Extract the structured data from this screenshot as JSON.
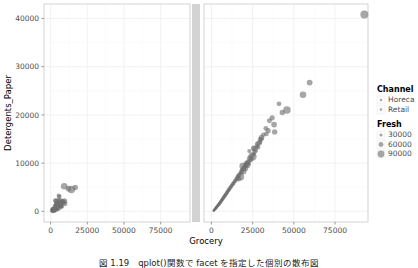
{
  "caption": "図 1.19　qplot()関数で facet を指定した個別の散布図",
  "chart_data": {
    "type": "scatter",
    "title": "",
    "xlabel": "Grocery",
    "ylabel": "Detergents_Paper",
    "xlim": [
      -4500,
      95000
    ],
    "ylim": [
      -2200,
      43000
    ],
    "xticks": [
      0,
      25000,
      50000,
      75000
    ],
    "xticklabels": [
      "0",
      "25000",
      "50000",
      "75000"
    ],
    "yticks": [
      0,
      10000,
      20000,
      30000,
      40000
    ],
    "yticklabels": [
      "0",
      "10000",
      "20000",
      "30000",
      "40000"
    ],
    "grid": true,
    "facet_by": "Channel",
    "facet_panels": [
      "Horeca",
      "Retail"
    ],
    "size_by": "Fresh",
    "point_color": "#6f6f6f",
    "point_opacity": 0.62,
    "legends": [
      {
        "title": "Channel",
        "position": "right",
        "entries": [
          {
            "label": "Horeca"
          },
          {
            "label": "Retail"
          }
        ]
      },
      {
        "title": "Fresh",
        "position": "right",
        "entries": [
          {
            "label": "30000",
            "size": 1.5
          },
          {
            "label": "60000",
            "size": 2.4
          },
          {
            "label": "90000",
            "size": 3.4
          }
        ]
      }
    ],
    "series": [
      {
        "name": "Horeca",
        "panel": 0,
        "points": [
          [
            3516,
            1382,
            7057
          ],
          [
            7684,
            965,
            6353
          ],
          [
            4221,
            507,
            13265
          ],
          [
            6747,
            1153,
            9413
          ],
          [
            9656,
            1630,
            12126
          ],
          [
            5614,
            3242,
            7579
          ],
          [
            2310,
            353,
            18601
          ],
          [
            5570,
            1696,
            9396
          ],
          [
            1630,
            443,
            10766
          ],
          [
            3253,
            2223,
            9612
          ],
          [
            3860,
            2134,
            11355
          ],
          [
            5963,
            3045,
            7723
          ],
          [
            1345,
            166,
            13162
          ],
          [
            1535,
            437,
            5734
          ],
          [
            3868,
            547,
            9374
          ],
          [
            2395,
            223,
            3352
          ],
          [
            6115,
            2150,
            17254
          ],
          [
            2755,
            323,
            1996
          ],
          [
            2095,
            294,
            9198
          ],
          [
            1980,
            168,
            6633
          ],
          [
            3608,
            545,
            5963
          ],
          [
            4352,
            1499,
            12471
          ],
          [
            1138,
            117,
            1980
          ],
          [
            1547,
            190,
            2366
          ],
          [
            3192,
            540,
            6006
          ],
          [
            4051,
            1268,
            4441
          ],
          [
            4739,
            828,
            5005
          ],
          [
            5337,
            2109,
            15729
          ],
          [
            1821,
            287,
            5396
          ],
          [
            5678,
            742,
            13265
          ],
          [
            2705,
            393,
            4098
          ],
          [
            7452,
            1030,
            6269
          ],
          [
            3062,
            1072,
            10766
          ],
          [
            2188,
            308,
            2346
          ],
          [
            6897,
            1212,
            6827
          ],
          [
            3251,
            477,
            4591
          ],
          [
            4576,
            1532,
            16165
          ],
          [
            2093,
            244,
            7173
          ],
          [
            1507,
            165,
            3428
          ],
          [
            5372,
            1077,
            10617
          ],
          [
            2765,
            455,
            7149
          ],
          [
            3576,
            572,
            6240
          ],
          [
            1986,
            257,
            5181
          ],
          [
            8638,
            1907,
            12669
          ],
          [
            2741,
            308,
            3366
          ],
          [
            5029,
            1249,
            8590
          ],
          [
            1753,
            201,
            2532
          ],
          [
            3589,
            1092,
            9919
          ],
          [
            2164,
            315,
            6038
          ],
          [
            6289,
            1812,
            11594
          ],
          [
            1384,
            173,
            2225
          ],
          [
            4568,
            792,
            7790
          ],
          [
            2873,
            470,
            4096
          ],
          [
            9410,
            2127,
            14276
          ],
          [
            1299,
            128,
            1663
          ],
          [
            3743,
            669,
            5509
          ],
          [
            2412,
            323,
            3547
          ],
          [
            5864,
            1553,
            9664
          ],
          [
            1943,
            228,
            4164
          ],
          [
            7127,
            1390,
            8265
          ],
          [
            3301,
            523,
            5920
          ],
          [
            2066,
            274,
            2893
          ],
          [
            4385,
            958,
            6833
          ],
          [
            1687,
            190,
            2008
          ],
          [
            6563,
            1690,
            10590
          ],
          [
            2548,
            371,
            4465
          ],
          [
            3939,
            748,
            6352
          ],
          [
            1484,
            151,
            1900
          ],
          [
            5190,
            1188,
            8077
          ],
          [
            2280,
            301,
            3291
          ],
          [
            8083,
            2079,
            13151
          ],
          [
            1776,
            218,
            2641
          ],
          [
            4830,
            1031,
            7414
          ],
          [
            3128,
            486,
            5121
          ],
          [
            2393,
            282,
            3846
          ],
          [
            6912,
            1588,
            9801
          ],
          [
            1591,
            177,
            2187
          ],
          [
            4107,
            826,
            6604
          ],
          [
            2687,
            402,
            4388
          ],
          [
            5499,
            1336,
            8869
          ],
          [
            1421,
            143,
            1745
          ],
          [
            3425,
            598,
            5342
          ],
          [
            2115,
            256,
            3020
          ],
          [
            7649,
            1921,
            11838
          ],
          [
            1867,
            231,
            2760
          ],
          [
            4991,
            1104,
            7992
          ],
          [
            2934,
            445,
            4723
          ],
          [
            6180,
            1452,
            9215
          ],
          [
            1344,
            136,
            1588
          ],
          [
            3771,
            691,
            5788
          ],
          [
            2238,
            289,
            3404
          ],
          [
            5755,
            1401,
            9037
          ],
          [
            1682,
            196,
            2322
          ],
          [
            4274,
            893,
            6945
          ],
          [
            3021,
            516,
            5006
          ],
          [
            2511,
            341,
            3715
          ],
          [
            6490,
            1523,
            10130
          ],
          [
            1498,
            159,
            1958
          ],
          [
            12220,
            4720,
            16117
          ],
          [
            9265,
            5203,
            22686
          ],
          [
            14160,
            4521,
            31714
          ],
          [
            16784,
            4948,
            13146
          ]
        ]
      },
      {
        "name": "Retail",
        "panel": 1,
        "points": [
          [
            92780,
            40827,
            36847
          ],
          [
            59598,
            26701,
            16117
          ],
          [
            55571,
            24171,
            22686
          ],
          [
            45828,
            21042,
            31714
          ],
          [
            38369,
            16483,
            13146
          ],
          [
            36847,
            19410,
            12212
          ],
          [
            34454,
            16745,
            11314
          ],
          [
            33305,
            16064,
            8797
          ],
          [
            30243,
            14981,
            10253
          ],
          [
            29627,
            14351,
            5908
          ],
          [
            28326,
            13302,
            7780
          ],
          [
            27714,
            13507,
            6633
          ],
          [
            26613,
            12444,
            9579
          ],
          [
            25862,
            11948,
            5181
          ],
          [
            24984,
            11623,
            10150
          ],
          [
            24170,
            11138,
            4591
          ],
          [
            23624,
            10758,
            8590
          ],
          [
            22272,
            10069,
            3884
          ],
          [
            21696,
            9873,
            6827
          ],
          [
            20970,
            9605,
            11594
          ],
          [
            20248,
            9132,
            4098
          ],
          [
            19813,
            8993,
            7790
          ],
          [
            19344,
            8804,
            3352
          ],
          [
            18828,
            8550,
            6240
          ],
          [
            18372,
            8358,
            5005
          ],
          [
            17866,
            7994,
            9919
          ],
          [
            17327,
            7841,
            2532
          ],
          [
            16851,
            7585,
            5920
          ],
          [
            16385,
            7307,
            4164
          ],
          [
            15976,
            7155,
            8265
          ],
          [
            15543,
            6876,
            2893
          ],
          [
            15166,
            6713,
            6038
          ],
          [
            14767,
            6486,
            3547
          ],
          [
            14388,
            6331,
            7149
          ],
          [
            13963,
            6122,
            2346
          ],
          [
            13591,
            5961,
            5121
          ],
          [
            13222,
            5772,
            4441
          ],
          [
            12893,
            5612,
            6269
          ],
          [
            12504,
            5419,
            1996
          ],
          [
            12186,
            5288,
            4388
          ],
          [
            11838,
            5101,
            3366
          ],
          [
            11518,
            4956,
            6352
          ],
          [
            11203,
            4779,
            2225
          ],
          [
            10886,
            4648,
            5342
          ],
          [
            10581,
            4474,
            3428
          ],
          [
            10292,
            4341,
            5509
          ],
          [
            9988,
            4173,
            1900
          ],
          [
            9713,
            4049,
            4465
          ],
          [
            9428,
            3882,
            2641
          ],
          [
            9163,
            3769,
            5006
          ],
          [
            8897,
            3614,
            1745
          ],
          [
            8640,
            3502,
            4096
          ],
          [
            8386,
            3358,
            2760
          ],
          [
            8141,
            3251,
            4723
          ],
          [
            7898,
            3114,
            1588
          ],
          [
            7663,
            3009,
            3715
          ],
          [
            7433,
            2879,
            2322
          ],
          [
            7206,
            2780,
            4388
          ],
          [
            6984,
            2655,
            1663
          ],
          [
            6769,
            2559,
            3404
          ],
          [
            6556,
            2441,
            2187
          ],
          [
            6350,
            2349,
            3846
          ],
          [
            6147,
            2238,
            1958
          ],
          [
            5949,
            2150,
            3291
          ],
          [
            5755,
            2046,
            2008
          ],
          [
            5566,
            1963,
            3020
          ],
          [
            5380,
            1866,
            1680
          ],
          [
            5198,
            1788,
            2893
          ],
          [
            5020,
            1699,
            1903
          ],
          [
            4846,
            1625,
            2641
          ],
          [
            4675,
            1542,
            1521
          ],
          [
            4508,
            1472,
            2322
          ],
          [
            4345,
            1394,
            1775
          ],
          [
            4185,
            1328,
            2187
          ],
          [
            4028,
            1255,
            1408
          ],
          [
            3875,
            1193,
            2008
          ],
          [
            3725,
            1124,
            1655
          ],
          [
            3578,
            1065,
            1900
          ],
          [
            3435,
            1000,
            1302
          ],
          [
            3294,
            944,
            1745
          ],
          [
            3157,
            882,
            1530
          ],
          [
            3022,
            829,
            1588
          ],
          [
            2891,
            771,
            1210
          ],
          [
            2762,
            721,
            1401
          ],
          [
            2637,
            666,
            1450
          ],
          [
            2514,
            618,
            1135
          ],
          [
            2394,
            566,
            1322
          ],
          [
            2277,
            521,
            1060
          ],
          [
            2162,
            472,
            1241
          ],
          [
            2051,
            429,
            996
          ],
          [
            1942,
            383,
            1170
          ],
          [
            1835,
            342,
            932
          ],
          [
            1731,
            298,
            1085
          ],
          [
            1630,
            259,
            875
          ],
          [
            1531,
            218,
            1002
          ],
          [
            1435,
            181,
            820
          ],
          [
            1341,
            142,
            940
          ],
          [
            1250,
            107,
            768
          ],
          [
            26369,
            12940,
            19410
          ],
          [
            23527,
            10894,
            25000
          ],
          [
            30379,
            15297,
            14000
          ],
          [
            21632,
            9740,
            30000
          ],
          [
            27864,
            13961,
            11000
          ],
          [
            33000,
            17200,
            9500
          ],
          [
            24900,
            11400,
            42000
          ],
          [
            19200,
            8400,
            28000
          ],
          [
            17500,
            7200,
            35000
          ],
          [
            22100,
            10100,
            18000
          ],
          [
            31500,
            15900,
            8200
          ],
          [
            28900,
            14200,
            13800
          ],
          [
            20400,
            9000,
            22400
          ],
          [
            16300,
            6800,
            16900
          ],
          [
            35200,
            18800,
            10400
          ],
          [
            29500,
            14900,
            7100
          ],
          [
            43000,
            20500,
            12800
          ],
          [
            41000,
            22300,
            9900
          ],
          [
            38000,
            18000,
            15200
          ],
          [
            23000,
            12500,
            6400
          ],
          [
            18900,
            9400,
            20800
          ],
          [
            25600,
            13100,
            11700
          ]
        ]
      }
    ]
  }
}
